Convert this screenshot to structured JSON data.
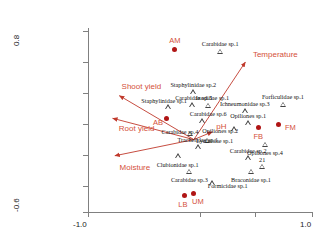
{
  "chart_data": {
    "type": "scatter",
    "title": "",
    "xlabel": "",
    "ylabel": "",
    "xlim": [
      -1.0,
      1.0
    ],
    "ylim": [
      -0.6,
      0.8
    ],
    "grid": false,
    "legend": "none",
    "axes": {
      "x_ticks": [
        "-1.0",
        "1.0"
      ],
      "y_ticks": [
        "0.8",
        "-0.6"
      ]
    },
    "site_scores": {
      "name": "sites",
      "marker": "filled-circle",
      "color": "#b01515",
      "label_color": "#d4503a",
      "points": [
        {
          "label": "AM",
          "x": -0.225,
          "y": 0.66
        },
        {
          "label": "AB",
          "x": -0.295,
          "y": 0.12
        },
        {
          "label": "FB",
          "x": 0.52,
          "y": 0.055
        },
        {
          "label": "FM",
          "x": 0.7,
          "y": 0.08
        },
        {
          "label": "LB",
          "x": -0.135,
          "y": -0.47
        },
        {
          "label": "UM",
          "x": -0.055,
          "y": -0.455
        }
      ]
    },
    "species_scores": {
      "name": "taxa",
      "marker": "open-triangle",
      "color": "#444444",
      "label_color": "#111111",
      "points": [
        {
          "label": "Carabidae sp.1",
          "x": 0.18,
          "y": 0.645
        },
        {
          "label": "Staphylinidae sp.2",
          "x": -0.06,
          "y": 0.33
        },
        {
          "label": "Staphylinidae sp.1",
          "x": -0.285,
          "y": 0.215
        },
        {
          "label": "Carabidae sp.5",
          "x": -0.075,
          "y": 0.23
        },
        {
          "label": "Ixodidae sp.1",
          "x": 0.075,
          "y": 0.225
        },
        {
          "label": "Carabidae sp.6",
          "x": 0.02,
          "y": 0.105
        },
        {
          "label": "Carabidae sp.4",
          "x": -0.09,
          "y": 0.01
        },
        {
          "label": "Lycosidae sp.1",
          "x": 0.06,
          "y": -0.045
        },
        {
          "label": "Trachelidae sp.1",
          "x": -0.02,
          "y": -0.095
        },
        {
          "label": "Clubionidae sp.1",
          "x": -0.2,
          "y": -0.165
        },
        {
          "label": "Carabidae sp.3",
          "x": -0.095,
          "y": -0.285
        },
        {
          "label": "Ichneumonidae sp.3",
          "x": 0.4,
          "y": 0.185
        },
        {
          "label": "Forficulidae sp.1",
          "x": 0.74,
          "y": 0.235
        },
        {
          "label": "Opiliones sp.1",
          "x": 0.43,
          "y": 0.09
        },
        {
          "label": "Opiliones sp.2",
          "x": 0.305,
          "y": 0.045
        },
        {
          "label": "Opiliones sp.4",
          "x": 0.58,
          "y": -0.075
        },
        {
          "label": "Carabidae sp.2",
          "x": 0.43,
          "y": -0.18
        },
        {
          "label": "21",
          "x": 0.555,
          "y": -0.245
        },
        {
          "label": "Braconidae sp.1",
          "x": 0.455,
          "y": -0.285
        },
        {
          "label": "Formicidae sp.1",
          "x": 0.105,
          "y": -0.375
        }
      ]
    },
    "env_vectors": {
      "name": "environmental variables",
      "color": "#c0392b",
      "arrows": [
        {
          "label": "Temperature",
          "x0": -0.055,
          "y0": -0.04,
          "x1": 0.405,
          "y1": 0.56
        },
        {
          "label": "pH",
          "x0": -0.055,
          "y0": -0.04,
          "x1": 0.11,
          "y1": 0.02
        },
        {
          "label": "Shoot yield",
          "x0": -0.055,
          "y0": -0.04,
          "x1": -0.72,
          "y1": 0.3
        },
        {
          "label": "Root yield",
          "x0": -0.055,
          "y0": -0.04,
          "x1": -0.78,
          "y1": 0.125
        },
        {
          "label": "Moisture",
          "x0": -0.055,
          "y0": -0.04,
          "x1": -0.76,
          "y1": -0.165
        }
      ]
    }
  }
}
